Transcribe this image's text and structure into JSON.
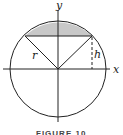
{
  "figure": {
    "caption": "FIGURE 10",
    "labels": {
      "y_axis": "y",
      "x_axis": "x",
      "radius": "r",
      "height": "h"
    },
    "colors": {
      "segment_fill": "#c8c8c8",
      "stroke": "#222222"
    }
  }
}
